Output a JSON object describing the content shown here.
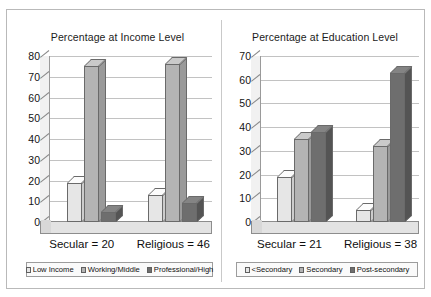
{
  "figure": {
    "background": "#ffffff",
    "frame_color": "#b9b9b9"
  },
  "palette": {
    "series1": "#e6e6e6",
    "series1_top": "#f4f4f4",
    "series1_side": "#cfcfcf",
    "series2": "#b4b4b4",
    "series2_top": "#cccccc",
    "series2_side": "#9a9a9a",
    "series3": "#6e6e6e",
    "series3_top": "#8a8a8a",
    "series3_side": "#545454",
    "gridline": "#c2c2c2",
    "axis": "#7d7d7d",
    "text": "#141414"
  },
  "chart_data": [
    {
      "type": "bar",
      "id": "income-chart",
      "title": "Percentage at Income Level",
      "xlabel": "",
      "ylabel": "",
      "ylim": [
        0,
        80
      ],
      "yticks": [
        0,
        10,
        20,
        30,
        40,
        50,
        60,
        70,
        80
      ],
      "ytick_labels": [
        "0",
        "10",
        "20",
        "30",
        "40",
        "50",
        "60",
        "70",
        "80"
      ],
      "grid": true,
      "legend_position": "bottom",
      "three_d": true,
      "categories": [
        "Secular = 20",
        "Religious = 46"
      ],
      "series": [
        {
          "name": "Low Income",
          "values": [
            19,
            13
          ],
          "color": "#e6e6e6"
        },
        {
          "name": "Working/Middle",
          "values": [
            75,
            76
          ],
          "color": "#b4b4b4"
        },
        {
          "name": "Professional/High",
          "values": [
            5,
            9
          ],
          "color": "#6e6e6e"
        }
      ]
    },
    {
      "type": "bar",
      "id": "education-chart",
      "title": "Percentage at Education Level",
      "xlabel": "",
      "ylabel": "",
      "ylim": [
        0,
        70
      ],
      "yticks": [
        0,
        10,
        20,
        30,
        40,
        50,
        60,
        70
      ],
      "ytick_labels": [
        "0",
        "10",
        "20",
        "30",
        "40",
        "50",
        "60",
        "70"
      ],
      "grid": true,
      "legend_position": "bottom",
      "three_d": true,
      "categories": [
        "Secular = 21",
        "Religious = 38"
      ],
      "series": [
        {
          "name": "<Secondary",
          "values": [
            19,
            5
          ],
          "color": "#e6e6e6"
        },
        {
          "name": "Secondary",
          "values": [
            35,
            32
          ],
          "color": "#b4b4b4"
        },
        {
          "name": "Post-secondary",
          "values": [
            38,
            63
          ],
          "color": "#6e6e6e"
        }
      ]
    }
  ]
}
